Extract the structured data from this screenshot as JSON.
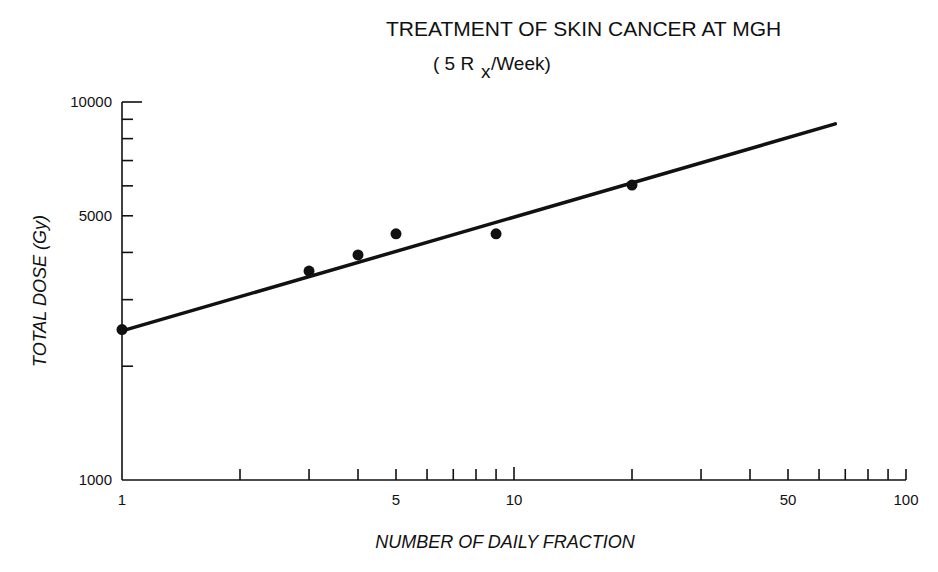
{
  "chart_data": {
    "type": "scatter",
    "title": "TREATMENT OF SKIN CANCER AT MGH",
    "subtitle_prefix": "( 5 R",
    "subtitle_sub": "x",
    "subtitle_suffix": "/Week)",
    "xlabel": "NUMBER OF DAILY FRACTION",
    "ylabel": "TOTAL DOSE (Gy)",
    "xscale": "log",
    "yscale": "log",
    "xlim": [
      1,
      100
    ],
    "ylim": [
      1000,
      10000
    ],
    "grid": false,
    "x_tick_labels": [
      {
        "value": 1,
        "label": "1"
      },
      {
        "value": 5,
        "label": "5"
      },
      {
        "value": 10,
        "label": "10"
      },
      {
        "value": 50,
        "label": "50"
      },
      {
        "value": 100,
        "label": "100"
      }
    ],
    "x_minor_ticks": [
      2,
      3,
      4,
      5,
      6,
      7,
      8,
      9,
      10,
      20,
      30,
      40,
      50,
      60,
      70,
      80,
      90,
      100
    ],
    "y_tick_labels": [
      {
        "value": 1000,
        "label": "1000"
      },
      {
        "value": 5000,
        "label": "5000"
      },
      {
        "value": 10000,
        "label": "10000"
      }
    ],
    "y_minor_ticks": [
      2000,
      3000,
      4000,
      5000,
      6000,
      7000,
      8000,
      9000,
      10000
    ],
    "series": [
      {
        "name": "observed",
        "type": "scatter",
        "points": [
          {
            "x": 1,
            "y": 2500
          },
          {
            "x": 3,
            "y": 3570
          },
          {
            "x": 4,
            "y": 3940
          },
          {
            "x": 5,
            "y": 4480
          },
          {
            "x": 9,
            "y": 4480
          },
          {
            "x": 20,
            "y": 6030
          }
        ]
      },
      {
        "name": "fit",
        "type": "line",
        "points": [
          {
            "x": 1,
            "y": 2480
          },
          {
            "x": 66,
            "y": 8750
          }
        ]
      }
    ]
  }
}
